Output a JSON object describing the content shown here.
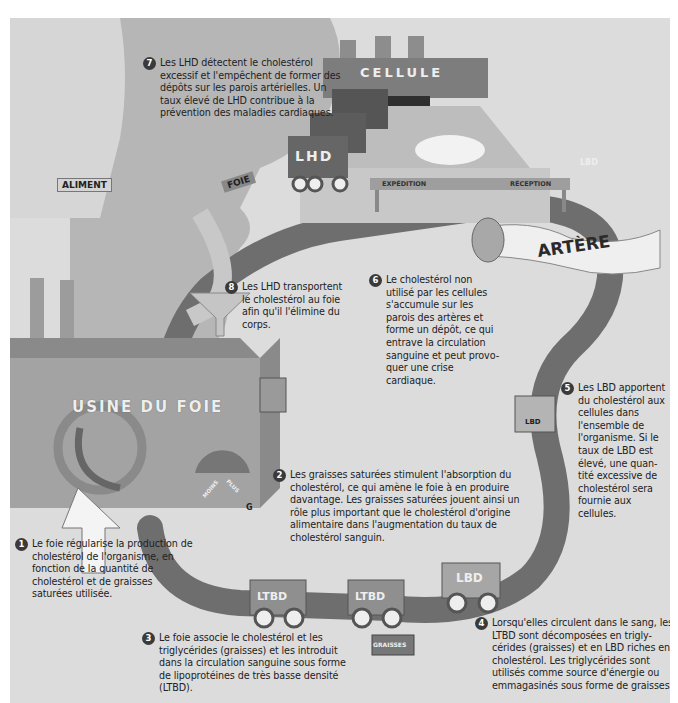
{
  "diagram": {
    "background_colors": {
      "panel": "#dcdcdc",
      "head_silhouette": "#b8b8b8",
      "pathway": "#6e6e6e",
      "factory": "#9a9a9a",
      "text": "#222222",
      "badge": "#3a3a3a"
    },
    "labels": {
      "cellule": "CELLULE",
      "lhd_truck": "LHD",
      "expedition": "EXPÉDITION",
      "reception": "RÉCEPTION",
      "lbd_cart_top": "LBD",
      "artere": "ARTÈRE",
      "foie_sign": "FOIE",
      "aliment_sign": "ALIMENT",
      "usine_du_foie": "USINE DU FOIE",
      "gauge_moins": "MOINS",
      "gauge_plus": "PLUS",
      "worker_badge": "G",
      "ltbd_cart_1": "LTBD",
      "ltbd_cart_2": "LTBD",
      "lbd_cart_bottom": "LBD",
      "lbd_box_right": "LBD",
      "graisses_sign": "GRAISSES"
    },
    "steps": [
      {
        "number": "1",
        "text": "Le foie régularise la production de cholestérol de l'organisme, en fonction de la quantité de cholestérol et de graisses saturées utilisée."
      },
      {
        "number": "2",
        "text": "Les graisses saturées stimulent l'absorption du cholestérol, ce qui amène le foie à en produire davantage. Les graisses saturées jouent ainsi un rôle plus important que le cholestérol d'origine alimentaire dans l'augmentation du taux de cholestérol sanguin."
      },
      {
        "number": "3",
        "text": "Le foie associe le cholestérol et les triglycérides (graisses) et les introduit dans la circulation sanguine sous forme de lipoprotéines de très basse densité (LTBD)."
      },
      {
        "number": "4",
        "text": "Lorsqu'elles circulent dans le sang, les LTBD sont décomposées en trigly-cérides (graisses) et en LBD riches en cholestérol. Les triglycérides sont utilisés comme source d'énergie ou emmagasinés sous forme de graisses."
      },
      {
        "number": "5",
        "text": "Les LBD apportent du cholestérol aux cellules dans l'ensemble de l'organisme. Si le taux de LBD est élevé, une quan-tité excessive de cholestérol sera fournie aux cellules."
      },
      {
        "number": "6",
        "text": "Le cholestérol non utilisé par les cellules s'accumule sur les parois des artères et forme un dépôt, ce qui entrave la circulation sanguine et peut provo-quer une crise cardiaque."
      },
      {
        "number": "7",
        "text": "Les LHD détectent le cholestérol excessif et l'empêchent de former des dépôts sur les parois artérielles. Un taux élevé de LHD contribue à la prévention des maladies cardiaques."
      },
      {
        "number": "8",
        "text": "Les LHD transportent le cholestérol au foie afin qu'il l'élimine du corps."
      }
    ]
  }
}
